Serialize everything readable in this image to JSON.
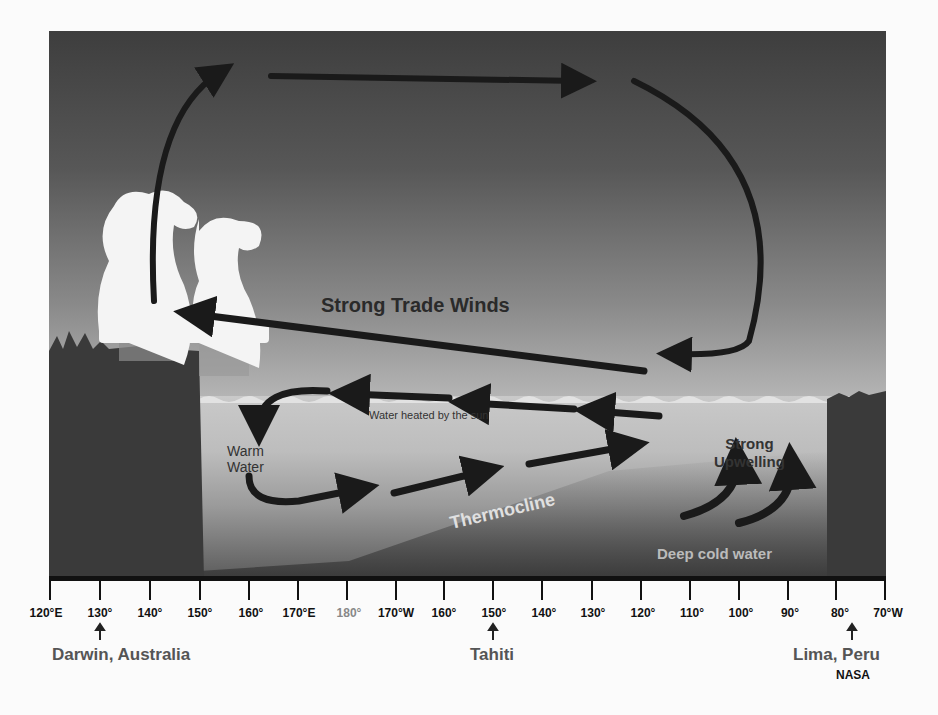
{
  "diagram": {
    "title_labels": {
      "trade_winds": "Strong Trade Winds",
      "water_heated": "Water heated by the sun",
      "warm_water_line1": "Warm",
      "warm_water_line2": "Water",
      "upwelling_line1": "Strong",
      "upwelling_line2": "Upwelling",
      "thermocline": "Thermocline",
      "deep_cold": "Deep cold water"
    },
    "axis": {
      "ticks": [
        "120°E",
        "130°",
        "140°",
        "150°",
        "160°",
        "170°E",
        "180°",
        "170°W",
        "160°",
        "150°",
        "140°",
        "130°",
        "120°",
        "110°",
        "100°",
        "90°",
        "80°",
        "70°W"
      ]
    },
    "locations": {
      "darwin": "Darwin, Australia",
      "tahiti": "Tahiti",
      "lima": "Lima, Peru"
    },
    "credit": "NASA",
    "colors": {
      "sky_top": "#3e3e3e",
      "land": "#3a3a3a",
      "arrow": "#1a1a1a",
      "cloud": "#f4f4f4",
      "label_dark": "#333333",
      "label_light": "#dddddd"
    }
  }
}
